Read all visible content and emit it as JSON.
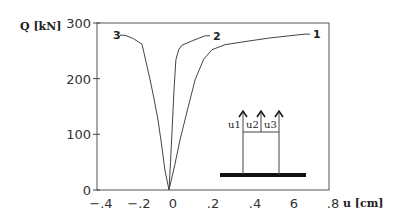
{
  "chart_data": {
    "type": "line",
    "title": "",
    "xlabel": "u [cm]",
    "ylabel": "Q [kN]",
    "xlim": [
      -0.4,
      0.8
    ],
    "ylim": [
      0,
      300
    ],
    "grid": false,
    "x_ticks": [
      {
        "value": -0.4,
        "label": "−.4"
      },
      {
        "value": -0.2,
        "label": "−.2"
      },
      {
        "value": 0,
        "label": "0"
      },
      {
        "value": 0.2,
        "label": ".2"
      },
      {
        "value": 0.4,
        "label": ".4"
      },
      {
        "value": 0.6,
        "label": "6"
      },
      {
        "value": 0.8,
        "label": ".8"
      }
    ],
    "y_ticks": [
      {
        "value": 0,
        "label": "0"
      },
      {
        "value": 100,
        "label": "100"
      },
      {
        "value": 200,
        "label": "200"
      },
      {
        "value": 300,
        "label": "300"
      }
    ],
    "series": [
      {
        "name": "1",
        "label": "1",
        "points": [
          [
            0,
            0
          ],
          [
            0.03,
            45
          ],
          [
            0.057,
            90
          ],
          [
            0.1,
            150
          ],
          [
            0.135,
            198
          ],
          [
            0.18,
            235
          ],
          [
            0.223,
            252
          ],
          [
            0.29,
            261
          ],
          [
            0.4,
            267
          ],
          [
            0.52,
            273
          ],
          [
            0.705,
            280
          ]
        ]
      },
      {
        "name": "2",
        "label": "2",
        "points": [
          [
            0,
            0
          ],
          [
            0.008,
            50
          ],
          [
            0.016,
            108
          ],
          [
            0.026,
            180
          ],
          [
            0.036,
            234
          ],
          [
            0.05,
            252
          ],
          [
            0.067,
            260
          ],
          [
            0.12,
            268
          ],
          [
            0.187,
            277
          ]
        ]
      },
      {
        "name": "3",
        "label": "3",
        "points": [
          [
            0,
            0
          ],
          [
            -0.021,
            36
          ],
          [
            -0.04,
            85
          ],
          [
            -0.057,
            126
          ],
          [
            -0.078,
            165
          ],
          [
            -0.098,
            198
          ],
          [
            -0.12,
            232
          ],
          [
            -0.14,
            262
          ],
          [
            -0.185,
            272
          ],
          [
            -0.228,
            278
          ]
        ]
      }
    ],
    "inset": {
      "description": "Pile group schematic with three upward displacement arrows",
      "labels": [
        "u1",
        "u2",
        "u3"
      ]
    }
  }
}
